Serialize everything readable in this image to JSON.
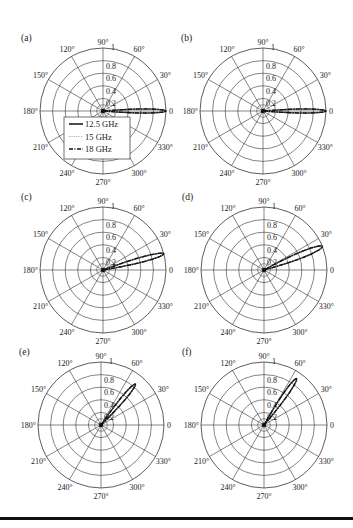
{
  "figure": {
    "width": 353,
    "height": 528,
    "colors": {
      "grid": "#333333",
      "text": "#222222",
      "background": "#ffffff",
      "rule": "#111111"
    }
  },
  "chart_data": [
    {
      "type": "polar",
      "panel_label": "(a)",
      "center": [
        103,
        111
      ],
      "radius": 63,
      "r_ticks": [
        "0.2",
        "0.4",
        "0.6",
        "0.8",
        "1"
      ],
      "r_max": 1,
      "angle_ticks": [
        "0",
        "30°",
        "60°",
        "90°",
        "120°",
        "150°",
        "180°",
        "210°",
        "240°",
        "270°",
        "300°",
        "330°"
      ],
      "beam_direction_deg": 0,
      "beam_peak": 1.0,
      "beam_halfwidth_deg": 4,
      "legend": {
        "visible": true,
        "entries": [
          {
            "label": "12.5 GHz",
            "style": "solid"
          },
          {
            "label": "15 GHz",
            "style": "dotted-gray"
          },
          {
            "label": "18 GHz",
            "style": "dash-dot"
          }
        ]
      },
      "series": [
        {
          "name": "12.5 GHz",
          "peak_angle_deg": 0,
          "peak_value": 1.0
        },
        {
          "name": "15 GHz",
          "peak_angle_deg": 0,
          "peak_value": 1.0
        },
        {
          "name": "18 GHz",
          "peak_angle_deg": 0,
          "peak_value": 1.0
        }
      ]
    },
    {
      "type": "polar",
      "panel_label": "(b)",
      "center": [
        263,
        111
      ],
      "radius": 63,
      "r_ticks": [
        "0.2",
        "0.4",
        "0.6",
        "0.8",
        "1"
      ],
      "r_max": 1,
      "angle_ticks": [
        "0",
        "30°",
        "60°",
        "90°",
        "120°",
        "150°",
        "180°",
        "210°",
        "240°",
        "270°",
        "300°",
        "330°"
      ],
      "beam_direction_deg": 0,
      "beam_peak": 1.0,
      "beam_halfwidth_deg": 4,
      "legend": {
        "visible": false
      },
      "series": [
        {
          "name": "12.5 GHz",
          "peak_angle_deg": 0,
          "peak_value": 1.0
        },
        {
          "name": "15 GHz",
          "peak_angle_deg": 0,
          "peak_value": 1.0
        },
        {
          "name": "18 GHz",
          "peak_angle_deg": 0,
          "peak_value": 1.0
        }
      ]
    },
    {
      "type": "polar",
      "panel_label": "(c)",
      "center": [
        103,
        270
      ],
      "radius": 63,
      "r_ticks": [
        "0.2",
        "0.4",
        "0.6",
        "0.8",
        "1"
      ],
      "r_max": 1,
      "angle_ticks": [
        "0",
        "30°",
        "60°",
        "90°",
        "120°",
        "150°",
        "180°",
        "210°",
        "240°",
        "270°",
        "300°",
        "330°"
      ],
      "beam_direction_deg": 15,
      "beam_peak": 1.0,
      "beam_halfwidth_deg": 5,
      "legend": {
        "visible": false
      },
      "series": [
        {
          "name": "12.5 GHz",
          "peak_angle_deg": 15,
          "peak_value": 1.0
        },
        {
          "name": "15 GHz",
          "peak_angle_deg": 15,
          "peak_value": 1.0
        },
        {
          "name": "18 GHz",
          "peak_angle_deg": 15,
          "peak_value": 1.0
        }
      ]
    },
    {
      "type": "polar",
      "panel_label": "(d)",
      "center": [
        264,
        270
      ],
      "radius": 63,
      "r_ticks": [
        "0.2",
        "0.4",
        "0.6",
        "0.8",
        "1"
      ],
      "r_max": 1,
      "angle_ticks": [
        "0",
        "30°",
        "60°",
        "90°",
        "120°",
        "150°",
        "180°",
        "210°",
        "240°",
        "270°",
        "300°",
        "330°"
      ],
      "beam_direction_deg": 22,
      "beam_peak": 1.0,
      "beam_halfwidth_deg": 6,
      "legend": {
        "visible": false
      },
      "series": [
        {
          "name": "12.5 GHz",
          "peak_angle_deg": 22,
          "peak_value": 1.0
        },
        {
          "name": "15 GHz",
          "peak_angle_deg": 22,
          "peak_value": 1.0
        },
        {
          "name": "18 GHz",
          "peak_angle_deg": 22,
          "peak_value": 1.0
        }
      ]
    },
    {
      "type": "polar",
      "panel_label": "(e)",
      "center": [
        101,
        425
      ],
      "radius": 63,
      "r_ticks": [
        "0.2",
        "0.4",
        "0.6",
        "0.8",
        "1"
      ],
      "r_max": 1,
      "angle_ticks": [
        "0",
        "30°",
        "60°",
        "90°",
        "120°",
        "150°",
        "180°",
        "210°",
        "240°",
        "270°",
        "300°",
        "330°"
      ],
      "beam_direction_deg": 50,
      "beam_peak": 0.85,
      "beam_halfwidth_deg": 5,
      "legend": {
        "visible": false
      },
      "series": [
        {
          "name": "12.5 GHz",
          "peak_angle_deg": 50,
          "peak_value": 0.85
        },
        {
          "name": "15 GHz",
          "peak_angle_deg": 50,
          "peak_value": 0.85
        },
        {
          "name": "18 GHz",
          "peak_angle_deg": 50,
          "peak_value": 0.85
        }
      ]
    },
    {
      "type": "polar",
      "panel_label": "(f)",
      "center": [
        264,
        425
      ],
      "radius": 63,
      "r_ticks": [
        "0.2",
        "0.4",
        "0.6",
        "0.8",
        "1"
      ],
      "r_max": 1,
      "angle_ticks": [
        "0",
        "30°",
        "60°",
        "90°",
        "120°",
        "150°",
        "180°",
        "210°",
        "240°",
        "270°",
        "300°",
        "330°"
      ],
      "beam_direction_deg": 55,
      "beam_peak": 0.9,
      "beam_halfwidth_deg": 5,
      "legend": {
        "visible": false
      },
      "series": [
        {
          "name": "12.5 GHz",
          "peak_angle_deg": 55,
          "peak_value": 0.9
        },
        {
          "name": "15 GHz",
          "peak_angle_deg": 55,
          "peak_value": 0.9
        },
        {
          "name": "18 GHz",
          "peak_angle_deg": 55,
          "peak_value": 0.9
        }
      ]
    }
  ]
}
